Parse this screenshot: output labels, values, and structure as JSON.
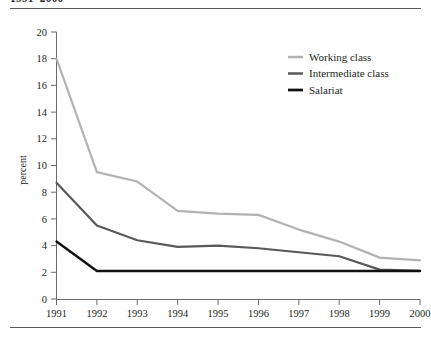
{
  "figure": {
    "caption_clipped": "1991–2000",
    "rules": {
      "color": "#5a5a5a"
    }
  },
  "chart_data": {
    "type": "line",
    "title": "",
    "xlabel": "",
    "ylabel": "percent",
    "x": [
      1991,
      1992,
      1993,
      1994,
      1995,
      1996,
      1997,
      1998,
      1999,
      2000
    ],
    "xtick_labels": [
      "1991",
      "1992",
      "1993",
      "1994",
      "1995",
      "1996",
      "1997",
      "1998",
      "1999",
      "2000"
    ],
    "ytick_labels": [
      "0",
      "2",
      "4",
      "6",
      "8",
      "10",
      "12",
      "14",
      "16",
      "18",
      "20"
    ],
    "yticks": [
      0,
      2,
      4,
      6,
      8,
      10,
      12,
      14,
      16,
      18,
      20
    ],
    "ylim": [
      0,
      20
    ],
    "xlim": [
      1991,
      2000
    ],
    "grid": false,
    "legend_position": "upper right",
    "series": [
      {
        "name": "Working class",
        "color": "#b3b3b3",
        "width": 2.2,
        "values": [
          18.0,
          9.5,
          8.8,
          6.6,
          6.4,
          6.3,
          5.2,
          4.3,
          3.1,
          2.9
        ]
      },
      {
        "name": "Intermediate class",
        "color": "#595959",
        "width": 2.2,
        "values": [
          8.7,
          5.5,
          4.4,
          3.9,
          4.0,
          3.8,
          3.5,
          3.2,
          2.2,
          2.1
        ]
      },
      {
        "name": "Salariat",
        "color": "#101010",
        "width": 2.4,
        "values": [
          4.3,
          2.1,
          2.1,
          2.1,
          2.1,
          2.1,
          2.1,
          2.1,
          2.1,
          2.1
        ]
      }
    ]
  }
}
